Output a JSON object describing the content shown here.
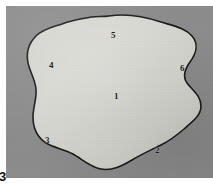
{
  "figure": {
    "number": "3",
    "background_color": "#8d8d8d",
    "blob_fill_color": "#dcdcd6",
    "blob_outline_color": "#161616",
    "label_color": "#1d1d1d",
    "plate_left": 6,
    "plate_top": 6,
    "plate_width": 207,
    "plate_height": 172
  },
  "labels": [
    {
      "text": "1",
      "x": 108,
      "y": 86,
      "name": "region-label-1"
    },
    {
      "text": "2",
      "x": 149,
      "y": 140,
      "name": "region-label-2"
    },
    {
      "text": "3",
      "x": 39,
      "y": 130,
      "name": "region-label-3"
    },
    {
      "text": "4",
      "x": 43,
      "y": 55,
      "name": "region-label-4"
    },
    {
      "text": "5",
      "x": 105,
      "y": 25,
      "name": "region-label-5"
    },
    {
      "text": "6",
      "x": 174,
      "y": 58,
      "name": "region-label-6"
    }
  ]
}
